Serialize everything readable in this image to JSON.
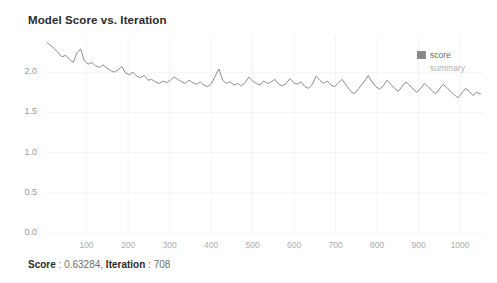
{
  "chart_data": {
    "type": "line",
    "title": "Model Score vs. Iteration",
    "xlabel": "",
    "ylabel": "",
    "xlim": [
      0,
      1060
    ],
    "ylim": [
      0.0,
      2.45
    ],
    "grid": true,
    "legend_position": "top-right",
    "y_ticks": [
      0.0,
      0.5,
      1.0,
      1.5,
      2.0
    ],
    "y_tick_labels": [
      "0.0",
      "0.5",
      "1.0",
      "1.5",
      "2.0"
    ],
    "x_ticks": [
      100,
      200,
      300,
      400,
      500,
      600,
      700,
      800,
      900,
      1000
    ],
    "x_tick_labels": [
      "100",
      "200",
      "300",
      "400",
      "500",
      "600",
      "700",
      "800",
      "900",
      "1000"
    ],
    "line_color": "#8c8c8c",
    "series": [
      {
        "name": "score",
        "color": "#8c8c8c",
        "x": [
          5,
          14,
          23,
          32,
          41,
          50,
          59,
          68,
          77,
          86,
          95,
          104,
          113,
          122,
          131,
          140,
          149,
          158,
          167,
          176,
          185,
          194,
          203,
          212,
          221,
          230,
          239,
          248,
          257,
          266,
          275,
          284,
          293,
          302,
          311,
          320,
          329,
          338,
          347,
          356,
          365,
          374,
          383,
          392,
          401,
          410,
          419,
          428,
          437,
          446,
          455,
          464,
          473,
          482,
          491,
          500,
          509,
          518,
          527,
          536,
          545,
          554,
          563,
          572,
          581,
          590,
          599,
          608,
          617,
          626,
          635,
          644,
          653,
          662,
          671,
          680,
          689,
          698,
          707,
          716,
          725,
          734,
          743,
          752,
          761,
          770,
          779,
          788,
          797,
          806,
          815,
          824,
          833,
          842,
          851,
          860,
          869,
          878,
          887,
          896,
          905,
          914,
          923,
          932,
          941,
          950,
          959,
          968,
          977,
          986,
          995,
          1004,
          1013,
          1022,
          1031,
          1040,
          1049
        ],
        "y": [
          2.37,
          2.33,
          2.29,
          2.24,
          2.19,
          2.21,
          2.16,
          2.12,
          2.24,
          2.29,
          2.14,
          2.1,
          2.12,
          2.08,
          2.06,
          2.09,
          2.05,
          2.02,
          2.0,
          2.03,
          2.07,
          1.99,
          1.97,
          2.0,
          1.95,
          1.93,
          1.96,
          1.9,
          1.91,
          1.88,
          1.86,
          1.89,
          1.87,
          1.9,
          1.94,
          1.91,
          1.88,
          1.86,
          1.9,
          1.87,
          1.85,
          1.88,
          1.84,
          1.82,
          1.86,
          1.95,
          2.04,
          1.9,
          1.86,
          1.88,
          1.84,
          1.86,
          1.83,
          1.87,
          1.94,
          1.89,
          1.86,
          1.84,
          1.89,
          1.86,
          1.88,
          1.91,
          1.85,
          1.83,
          1.86,
          1.92,
          1.87,
          1.85,
          1.88,
          1.82,
          1.8,
          1.85,
          1.95,
          1.9,
          1.86,
          1.89,
          1.84,
          1.82,
          1.87,
          1.91,
          1.84,
          1.78,
          1.73,
          1.77,
          1.83,
          1.89,
          1.96,
          1.88,
          1.82,
          1.79,
          1.83,
          1.9,
          1.85,
          1.8,
          1.76,
          1.82,
          1.88,
          1.84,
          1.79,
          1.75,
          1.8,
          1.86,
          1.82,
          1.77,
          1.73,
          1.79,
          1.85,
          1.81,
          1.76,
          1.72,
          1.68,
          1.74,
          1.8,
          1.76,
          1.71,
          1.75,
          1.73
        ]
      }
    ],
    "legend": [
      {
        "label": "score",
        "color": "#8a8a8a",
        "type": "swatch"
      },
      {
        "label": "summary",
        "color": "#b0b0b0",
        "type": "text"
      }
    ]
  },
  "footer": {
    "score_label": "Score",
    "score_sep": " : ",
    "score_value": "0.63284",
    "comma": ", ",
    "iteration_label": "Iteration",
    "iteration_sep": " : ",
    "iteration_value": "708"
  }
}
